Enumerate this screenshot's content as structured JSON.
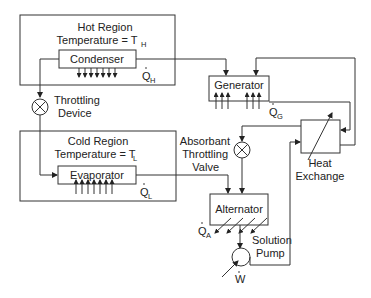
{
  "diagram": {
    "hot_region": {
      "title": "Hot Region",
      "temp_label": "Temperature = T",
      "temp_sub": "H"
    },
    "cold_region": {
      "title": "Cold Region",
      "temp_label": "Temperature = T",
      "temp_sub": "L"
    },
    "components": {
      "condenser": "Condenser",
      "evaporator": "Evaporator",
      "generator": "Generator",
      "alternator": "Alternator",
      "throttling_device_line1": "Throttling",
      "throttling_device_line2": "Device",
      "absorbant_valve_line1": "Absorbant",
      "absorbant_valve_line2": "Throttling",
      "absorbant_valve_line3": "Valve",
      "heat_exchange_line1": "Heat",
      "heat_exchange_line2": "Exchange",
      "solution_pump_line1": "Solution",
      "solution_pump_line2": "Pump"
    },
    "heat_flows": {
      "q_h": {
        "symbol": "Q",
        "sub": "H"
      },
      "q_l": {
        "symbol": "Q",
        "sub": "L"
      },
      "q_g": {
        "symbol": "Q",
        "sub": "G"
      },
      "q_a": {
        "symbol": "Q",
        "sub": "A"
      },
      "w": {
        "symbol": "W"
      }
    },
    "colors": {
      "stroke": "#333333",
      "text": "#222222",
      "background": "#ffffff"
    }
  }
}
